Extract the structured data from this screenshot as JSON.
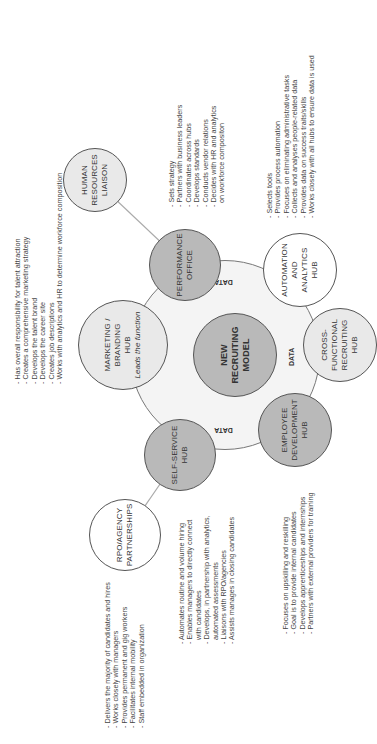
{
  "diagram": {
    "center": {
      "line1": "NEW",
      "line2": "RECRUITING",
      "line3": "MODEL"
    },
    "data_label": "DATA",
    "hubs": {
      "marketing": {
        "line1": "MARKETING /",
        "line2": "BRANDING",
        "line3": "HUB",
        "sub": "Leads the function"
      },
      "performance": {
        "line1": "PERFORMANCE",
        "line2": "OFFICE"
      },
      "automation": {
        "line1": "AUTOMATION",
        "line2": "AND",
        "line3": "ANALYTICS",
        "line4": "HUB"
      },
      "cross_functional": {
        "line1": "CROSS-",
        "line2": "FUNCTIONAL",
        "line3": "RECRUITING",
        "line4": "HUB"
      },
      "employee_dev": {
        "line1": "EMPLOYEE",
        "line2": "DEVELOPMENT",
        "line3": "HUB"
      },
      "self_service": {
        "line1": "SELF-SERVICE",
        "line2": "HUB"
      },
      "hr_liaison": {
        "line1": "HUMAN",
        "line2": "RESOURCES",
        "line3": "LIAISON"
      },
      "rpo": {
        "line1": "RPO/AGENCY",
        "line2": "PARTNERSHIPS"
      }
    },
    "lists": {
      "marketing": [
        "Has overall responsibility for talent attraction",
        "Creates a comprehensive marketing strategy",
        "Develops the talent brand",
        "Develops the career site",
        "Creates job descriptions",
        "Works with analytics and HR to determine workforce composition"
      ],
      "performance": [
        "Sets strategy",
        "Partners with business leaders",
        "Coordinates across hubs",
        "Develops standards",
        "Conducts vendor relations",
        "Decides with HR and analytics",
        "on workforce compositon"
      ],
      "automation": [
        "Selects tools",
        "Provides process automation",
        "Focuses on eliminating administrative tasks",
        "Collects and analyses people-related data",
        "Provides data on success traits/skills",
        "Works closely with all hubs to ensure data is used"
      ],
      "rpo": [
        "Delivers the majority of candidates and hires",
        "Works closely with managers",
        "Provides permanent and gig workers",
        "Facilitates internal mobility",
        "Staff embedded in organization"
      ],
      "self_service": [
        "Automates routine and volume hiring",
        "Enables managers to directly connect",
        "with candidates",
        "Develops, in partnership with analytics,",
        "automated assessments",
        "Liaisons with RPO/agencies",
        "Assists manages in closing candidates"
      ],
      "employee_dev": [
        "Focuses on upskilling and reskilling",
        "Goal is to provide internal candidates",
        "Develops apprenticeships and internships",
        "Partners with external providers for training"
      ]
    }
  }
}
